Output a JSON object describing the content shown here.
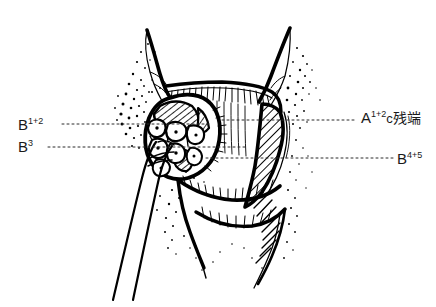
{
  "figure": {
    "kind": "anatomical-line-drawing",
    "style": "black-and-white pen-and-ink hatched illustration",
    "background_color": "#ffffff",
    "ink_color": "#000000",
    "leader_color": "#2b2b2b",
    "width": 436,
    "height": 307
  },
  "labels": {
    "b12": {
      "base": "B",
      "sup": "1+2",
      "full": "B1+2"
    },
    "b3": {
      "base": "B",
      "sup": "3",
      "full": "B3"
    },
    "a12c": {
      "base": "A",
      "sup": "1+2",
      "lower": "c",
      "cjk": "残端",
      "full": "A1+2c残端"
    },
    "b45": {
      "base": "B",
      "sup": "4+5",
      "full": "B4+5"
    }
  },
  "leaders": [
    {
      "name": "leader-b12",
      "from_x": 62,
      "from_y": 124,
      "to_x": 212,
      "to_y": 124
    },
    {
      "name": "leader-b3",
      "from_x": 48,
      "from_y": 147,
      "to_x": 246,
      "to_y": 147
    },
    {
      "name": "leader-a12c",
      "from_x": 357,
      "from_y": 120,
      "to_x": 222,
      "to_y": 120
    },
    {
      "name": "leader-b45",
      "from_x": 393,
      "from_y": 158,
      "to_x": 206,
      "to_y": 158
    }
  ]
}
